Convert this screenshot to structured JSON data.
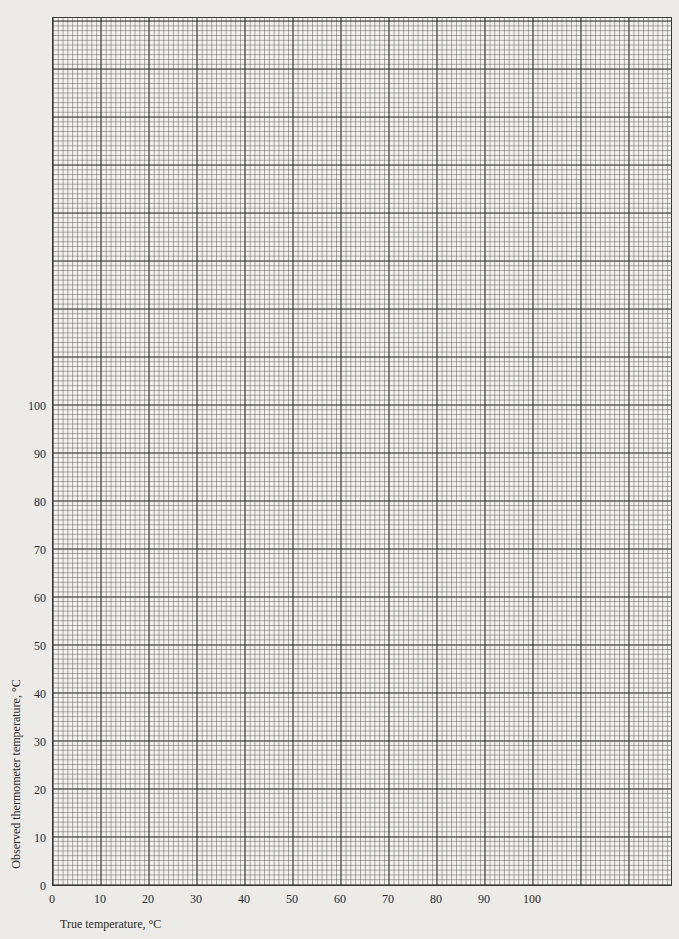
{
  "chart_data": {
    "type": "scatter",
    "title": "",
    "xlabel": "True temperature, °C",
    "ylabel": "Observed thermometer temperature, °C",
    "x_ticks": [
      "0",
      "10",
      "20",
      "30",
      "40",
      "50",
      "60",
      "70",
      "80",
      "90",
      "100"
    ],
    "y_ticks": [
      "0",
      "10",
      "20",
      "30",
      "40",
      "50",
      "60",
      "70",
      "80",
      "90",
      "100"
    ],
    "xlim": [
      0,
      129
    ],
    "ylim": [
      0,
      181
    ],
    "grid": true,
    "grid_major_step": 10,
    "grid_minor_step": 1,
    "series": [],
    "note": "Blank graph paper; no data points plotted"
  },
  "axes": {
    "x_label": "True temperature, °C",
    "y_label": "Observed thermometer temperature, °C"
  }
}
